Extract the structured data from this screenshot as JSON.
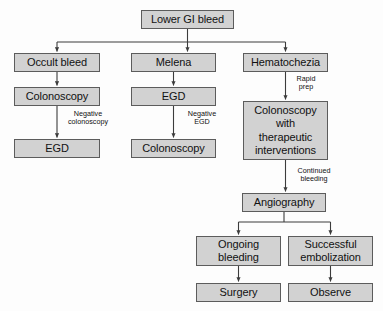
{
  "diagram": {
    "colors": {
      "node_fill": "#d2d2d2",
      "node_border": "#5c5c5c",
      "background": "#fdfdfd",
      "line": "#3c3c3c",
      "text": "#111111"
    },
    "nodes": [
      {
        "id": "lower_gi_bleed",
        "label": "Lower GI bleed",
        "x": 141,
        "y": 10,
        "w": 93,
        "h": 19
      },
      {
        "id": "occult_bleed",
        "label": "Occult bleed",
        "x": 14,
        "y": 53,
        "w": 86,
        "h": 19
      },
      {
        "id": "melena",
        "label": "Melena",
        "x": 131,
        "y": 53,
        "w": 85,
        "h": 19
      },
      {
        "id": "hematochezia",
        "label": "Hematochezia",
        "x": 243,
        "y": 53,
        "w": 85,
        "h": 19
      },
      {
        "id": "colonoscopy_left",
        "label": "Colonoscopy",
        "x": 14,
        "y": 87,
        "w": 86,
        "h": 19
      },
      {
        "id": "egd_mid",
        "label": "EGD",
        "x": 131,
        "y": 87,
        "w": 85,
        "h": 19
      },
      {
        "id": "colonoscopy_ther",
        "label": "Colonoscopy\nwith\ntherapeutic\ninterventions",
        "x": 243,
        "y": 101,
        "w": 85,
        "h": 59
      },
      {
        "id": "egd_left",
        "label": "EGD",
        "x": 14,
        "y": 139,
        "w": 86,
        "h": 19
      },
      {
        "id": "colonoscopy_mid",
        "label": "Colonoscopy",
        "x": 131,
        "y": 139,
        "w": 85,
        "h": 19
      },
      {
        "id": "angiography",
        "label": "Angiography",
        "x": 242,
        "y": 193,
        "w": 84,
        "h": 19
      },
      {
        "id": "ongoing_bleeding",
        "label": "Ongoing\nbleeding",
        "x": 196,
        "y": 236,
        "w": 85,
        "h": 30
      },
      {
        "id": "successful_emb",
        "label": "Successful\nembolization",
        "x": 288,
        "y": 236,
        "w": 85,
        "h": 30
      },
      {
        "id": "surgery",
        "label": "Surgery",
        "x": 196,
        "y": 283,
        "w": 85,
        "h": 19
      },
      {
        "id": "observe",
        "label": "Observe",
        "x": 288,
        "y": 283,
        "w": 85,
        "h": 19
      }
    ],
    "edge_labels": [
      {
        "id": "negative_colonoscopy",
        "text": "Negative\ncolonoscopy",
        "x": 60,
        "y": 110,
        "w": 56
      },
      {
        "id": "negative_egd",
        "text": "Negative\nEGD",
        "x": 178,
        "y": 110,
        "w": 48
      },
      {
        "id": "rapid_prep",
        "text": "Rapid\nprep",
        "x": 289,
        "y": 75,
        "w": 34
      },
      {
        "id": "continued_bleeding",
        "text": "Continued\nbleeding",
        "x": 288,
        "y": 167,
        "w": 52
      }
    ],
    "edges": [
      {
        "from": "lower_gi_bleed",
        "to": "occult_bleed",
        "type": "split"
      },
      {
        "from": "lower_gi_bleed",
        "to": "melena",
        "type": "straight"
      },
      {
        "from": "lower_gi_bleed",
        "to": "hematochezia",
        "type": "split"
      },
      {
        "from": "occult_bleed",
        "to": "colonoscopy_left",
        "type": "straight"
      },
      {
        "from": "colonoscopy_left",
        "to": "egd_left",
        "type": "straight",
        "label": "negative_colonoscopy"
      },
      {
        "from": "melena",
        "to": "egd_mid",
        "type": "straight"
      },
      {
        "from": "egd_mid",
        "to": "colonoscopy_mid",
        "type": "straight",
        "label": "negative_egd"
      },
      {
        "from": "hematochezia",
        "to": "colonoscopy_ther",
        "type": "straight",
        "label": "rapid_prep"
      },
      {
        "from": "colonoscopy_ther",
        "to": "angiography",
        "type": "straight",
        "label": "continued_bleeding"
      },
      {
        "from": "angiography",
        "to": "ongoing_bleeding",
        "type": "split"
      },
      {
        "from": "angiography",
        "to": "successful_emb",
        "type": "split"
      },
      {
        "from": "ongoing_bleeding",
        "to": "surgery",
        "type": "straight"
      },
      {
        "from": "successful_emb",
        "to": "observe",
        "type": "straight"
      }
    ]
  }
}
